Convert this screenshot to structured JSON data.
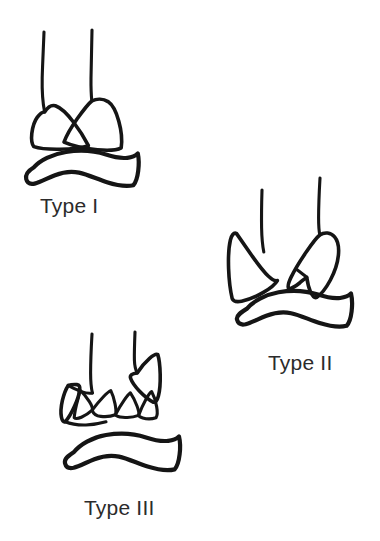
{
  "figure": {
    "background_color": "#ffffff",
    "ink_color": "#151515",
    "caption_color": "#2b2b2b",
    "panels": [
      {
        "id": "type-1",
        "label": "Type I",
        "label_x": 40,
        "label_y": 195,
        "description": "Nondisplaced fracture: tibia and fibula shafts with intact wedge-shaped distal articular block above an intact talus"
      },
      {
        "id": "type-2",
        "label": "Type II",
        "label_x": 268,
        "label_y": 352,
        "description": "Displaced fracture with incongruity: medial and lateral distal fragments separated, talus intact below"
      },
      {
        "id": "type-3",
        "label": "Type III",
        "label_x": 84,
        "label_y": 497,
        "description": "Comminuted fracture: multiple zigzag impacted articular fragments above the talus"
      }
    ]
  }
}
